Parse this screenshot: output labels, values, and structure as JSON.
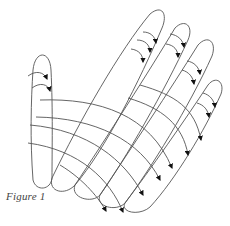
{
  "figure": {
    "caption": "Figure 1",
    "stroke_color": "#555555",
    "arrow_color": "#111111",
    "background": "#ffffff"
  }
}
